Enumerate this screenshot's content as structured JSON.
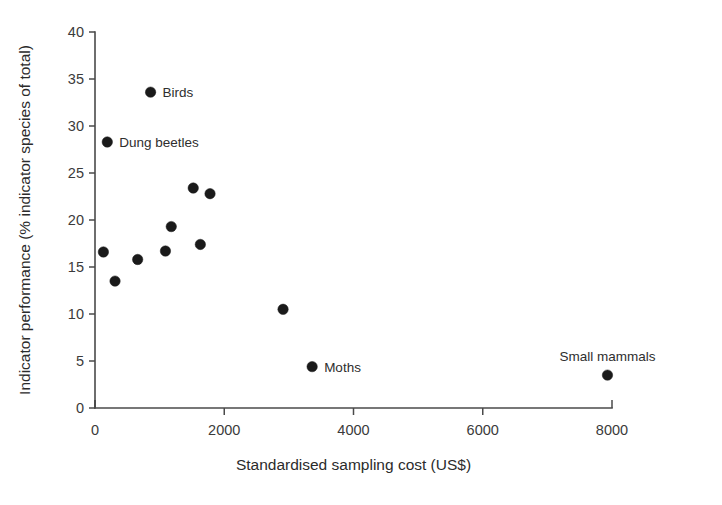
{
  "chart_data": {
    "type": "scatter",
    "title": "",
    "xlabel": "Standardised sampling cost (US$)",
    "ylabel": "Indicator performance (% indicator species of total)",
    "xlim": [
      0,
      8000
    ],
    "ylim": [
      0,
      40
    ],
    "xticks": [
      0,
      2000,
      4000,
      6000,
      8000
    ],
    "yticks": [
      0,
      5,
      10,
      15,
      20,
      25,
      30,
      35,
      40
    ],
    "xtick_labels": [
      "0",
      "2000",
      "4000",
      "6000",
      "8000"
    ],
    "ytick_labels": [
      "0",
      "5",
      "10",
      "15",
      "20",
      "25",
      "30",
      "35",
      "40"
    ],
    "grid": false,
    "legend": "none",
    "marker": "filled-circle",
    "marker_color": "#1a1a1a",
    "points": [
      {
        "x": 190,
        "y": 28.3,
        "label": "Dung beetles",
        "label_pos": "right"
      },
      {
        "x": 860,
        "y": 33.6,
        "label": "Birds",
        "label_pos": "right"
      },
      {
        "x": 130,
        "y": 16.6,
        "label": "",
        "label_pos": ""
      },
      {
        "x": 310,
        "y": 13.5,
        "label": "",
        "label_pos": ""
      },
      {
        "x": 660,
        "y": 15.8,
        "label": "",
        "label_pos": ""
      },
      {
        "x": 1090,
        "y": 16.7,
        "label": "",
        "label_pos": ""
      },
      {
        "x": 1180,
        "y": 19.3,
        "label": "",
        "label_pos": ""
      },
      {
        "x": 1520,
        "y": 23.4,
        "label": "",
        "label_pos": ""
      },
      {
        "x": 1630,
        "y": 17.4,
        "label": "",
        "label_pos": ""
      },
      {
        "x": 1780,
        "y": 22.8,
        "label": "",
        "label_pos": ""
      },
      {
        "x": 2910,
        "y": 10.5,
        "label": "",
        "label_pos": ""
      },
      {
        "x": 3360,
        "y": 4.4,
        "label": "Moths",
        "label_pos": "right"
      },
      {
        "x": 7930,
        "y": 3.5,
        "label": "Small mammals",
        "label_pos": "above"
      }
    ]
  }
}
